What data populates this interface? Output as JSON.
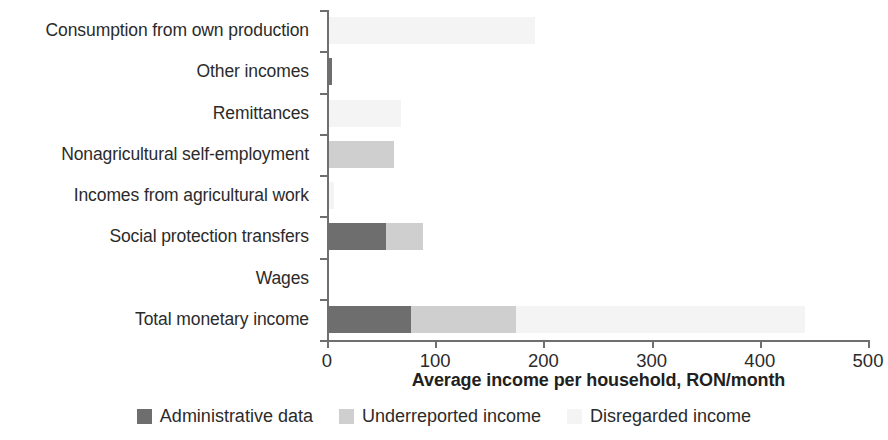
{
  "chart_data": {
    "type": "bar",
    "orientation": "horizontal",
    "stacked": true,
    "title": "",
    "xlabel": "Average income per household, RON/month",
    "ylabel": "",
    "xlim": [
      0,
      500
    ],
    "xticks": [
      "0",
      "100",
      "200",
      "300",
      "400",
      "500"
    ],
    "grid": false,
    "legend_position": "bottom",
    "categories": [
      "Consumption from own production",
      "Other incomes",
      "Remittances",
      "Nonagricultural self-employment",
      "Incomes from agricultural work",
      "Social protection transfers",
      "Wages",
      "Total monetary income"
    ],
    "series": [
      {
        "name": "Administrative data",
        "color": "#6e6e6e",
        "values": [
          0,
          3,
          0,
          0,
          0,
          53,
          0,
          76
        ]
      },
      {
        "name": "Underreported income",
        "color": "#cfcfcf",
        "values": [
          0,
          0,
          0,
          60,
          0,
          34,
          0,
          97
        ]
      },
      {
        "name": "Disregarded income",
        "color": "#f4f4f4",
        "values": [
          190,
          0,
          67,
          0,
          5,
          0,
          0,
          267
        ]
      }
    ]
  },
  "axis": {
    "x_title": "Average income per household, RON/month",
    "ticks": [
      "0",
      "100",
      "200",
      "300",
      "400",
      "500"
    ]
  },
  "legend": {
    "items": [
      {
        "label": "Administrative data",
        "color": "#6e6e6e"
      },
      {
        "label": "Underreported income",
        "color": "#cfcfcf"
      },
      {
        "label": "Disregarded income",
        "color": "#f4f4f4"
      }
    ]
  }
}
